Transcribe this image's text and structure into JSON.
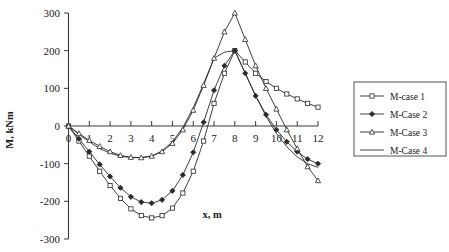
{
  "chart_data": {
    "type": "line",
    "title": "",
    "xlabel": "x, m",
    "ylabel": "M, kNm",
    "xlim": [
      0,
      12
    ],
    "ylim": [
      -300,
      300
    ],
    "xticks": [
      "0",
      "1",
      "2",
      "3",
      "4",
      "5",
      "6",
      "7",
      "8",
      "9",
      "10",
      "11",
      "12"
    ],
    "yticks": [
      "300",
      "200",
      "100",
      "0",
      "-100",
      "-200",
      "-300"
    ],
    "grid": false,
    "legend_position": "right",
    "x": [
      0,
      0.5,
      1,
      1.5,
      2,
      2.5,
      3,
      3.5,
      4,
      4.5,
      5,
      5.5,
      6,
      6.5,
      7,
      7.5,
      8,
      8.5,
      9,
      9.5,
      10,
      10.5,
      11,
      11.5,
      12
    ],
    "series": [
      {
        "name": "M-case 1",
        "marker": "square-open",
        "values": [
          0,
          -40,
          -80,
          -120,
          -158,
          -192,
          -220,
          -238,
          -244,
          -238,
          -218,
          -178,
          -120,
          -40,
          60,
          140,
          200,
          170,
          140,
          118,
          100,
          85,
          72,
          60,
          50
        ]
      },
      {
        "name": "M-Case 2",
        "marker": "diamond-solid",
        "values": [
          0,
          -34,
          -68,
          -102,
          -134,
          -164,
          -188,
          -202,
          -205,
          -196,
          -172,
          -130,
          -70,
          10,
          95,
          160,
          200,
          140,
          80,
          30,
          -10,
          -42,
          -68,
          -88,
          -100
        ]
      },
      {
        "name": "M-Case 3",
        "marker": "triangle-open",
        "values": [
          0,
          -20,
          -38,
          -54,
          -68,
          -78,
          -83,
          -84,
          -80,
          -68,
          -46,
          -10,
          42,
          108,
          180,
          250,
          300,
          230,
          160,
          100,
          45,
          -10,
          -60,
          -108,
          -145
        ]
      },
      {
        "name": "M-Case 4",
        "marker": "none",
        "values": [
          0,
          -22,
          -42,
          -60,
          -72,
          -80,
          -84,
          -84,
          -80,
          -66,
          -42,
          -4,
          48,
          112,
          180,
          196,
          200,
          140,
          80,
          26,
          -20,
          -55,
          -82,
          -100,
          -110
        ]
      }
    ]
  },
  "legend": {
    "items": [
      {
        "label": "M-case 1"
      },
      {
        "label": "M-Case 2"
      },
      {
        "label": "M-Case 3"
      },
      {
        "label": "M-Case 4"
      }
    ]
  },
  "colors": {
    "ink": "#2a2a2a",
    "axis": "#3a3a3a",
    "background": "#ffffff"
  }
}
